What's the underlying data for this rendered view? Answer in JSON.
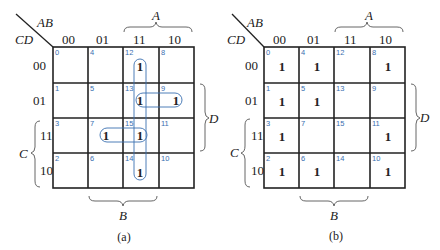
{
  "maps": [
    {
      "id": "a",
      "caption": "(a)",
      "corner": {
        "row_var": "AB",
        "col_var": "CD"
      },
      "column_labels": [
        "00",
        "01",
        "11",
        "10"
      ],
      "row_labels": [
        "00",
        "01",
        "11",
        "10"
      ],
      "brace_labels": {
        "A": "A",
        "B": "B",
        "C": "C",
        "D": "D"
      },
      "cell_indices": [
        [
          "0",
          "4",
          "12",
          "8"
        ],
        [
          "1",
          "5",
          "13",
          "9"
        ],
        [
          "3",
          "7",
          "15",
          "11"
        ],
        [
          "2",
          "6",
          "14",
          "10"
        ]
      ],
      "cell_values": [
        [
          "",
          "",
          "1",
          ""
        ],
        [
          "",
          "",
          "1",
          "1"
        ],
        [
          "",
          "1",
          "1",
          ""
        ],
        [
          "",
          "",
          "1",
          ""
        ]
      ],
      "groupings": [
        {
          "name": "vertical-column-11",
          "cells": [
            12,
            13,
            15,
            14
          ]
        },
        {
          "name": "horizontal-13-9",
          "cells": [
            13,
            9
          ]
        },
        {
          "name": "horizontal-7-15",
          "cells": [
            7,
            15
          ]
        }
      ],
      "loop_color": "#3a6fb0"
    },
    {
      "id": "b",
      "caption": "(b)",
      "corner": {
        "row_var": "AB",
        "col_var": "CD"
      },
      "column_labels": [
        "00",
        "01",
        "11",
        "10"
      ],
      "row_labels": [
        "00",
        "01",
        "11",
        "10"
      ],
      "brace_labels": {
        "A": "A",
        "B": "B",
        "C": "C",
        "D": "D"
      },
      "cell_indices": [
        [
          "0",
          "4",
          "12",
          "8"
        ],
        [
          "1",
          "5",
          "13",
          "9"
        ],
        [
          "3",
          "7",
          "15",
          "11"
        ],
        [
          "2",
          "6",
          "14",
          "10"
        ]
      ],
      "cell_values": [
        [
          "1",
          "1",
          "",
          "1"
        ],
        [
          "1",
          "1",
          "",
          ""
        ],
        [
          "1",
          "",
          "",
          "1"
        ],
        [
          "1",
          "1",
          "",
          "1"
        ]
      ]
    }
  ]
}
